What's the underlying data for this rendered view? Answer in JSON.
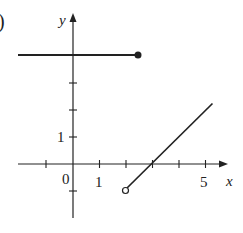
{
  "figure": {
    "panel_label": ")",
    "axes": {
      "x_label": "x",
      "y_label": "y",
      "origin_label": "0",
      "x_tick_labels": [
        {
          "value": 1,
          "label": "1"
        },
        {
          "value": 5,
          "label": "5"
        }
      ],
      "y_tick_labels": [
        {
          "value": 1,
          "label": "1"
        }
      ],
      "x_ticks": [
        -1,
        1,
        2,
        3,
        4,
        5
      ],
      "y_ticks": [
        -1,
        1,
        2,
        3
      ]
    },
    "pieces": [
      {
        "type": "segment",
        "from": [
          -2,
          4
        ],
        "to": [
          2,
          4
        ],
        "left_end": "none",
        "right_end": "closed"
      },
      {
        "type": "segment",
        "from": [
          2,
          -1
        ],
        "to": [
          5.25,
          2.25
        ],
        "left_end": "open",
        "right_end": "none"
      }
    ],
    "colors": {
      "stroke": "#222222",
      "background": "#ffffff"
    }
  }
}
